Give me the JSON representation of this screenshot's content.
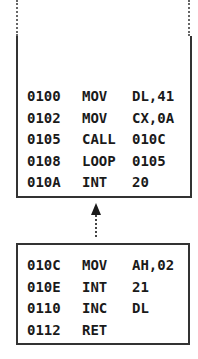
{
  "main_block": {
    "rows": [
      {
        "addr": "0100",
        "op": "MOV",
        "arg": "DL,41"
      },
      {
        "addr": "0102",
        "op": "MOV",
        "arg": "CX,0A"
      },
      {
        "addr": "0105",
        "op": "CALL",
        "arg": "010C"
      },
      {
        "addr": "0108",
        "op": "LOOP",
        "arg": "0105"
      },
      {
        "addr": "010A",
        "op": "INT",
        "arg": "20"
      }
    ]
  },
  "subroutine_block": {
    "rows": [
      {
        "addr": "010C",
        "op": "MOV",
        "arg": "AH,02"
      },
      {
        "addr": "010E",
        "op": "INT",
        "arg": "21"
      },
      {
        "addr": "0110",
        "op": "INC",
        "arg": "DL"
      },
      {
        "addr": "0112",
        "op": "RET",
        "arg": ""
      }
    ]
  },
  "arrow": {
    "icon": "arrow-up-icon",
    "style": "dotted"
  }
}
